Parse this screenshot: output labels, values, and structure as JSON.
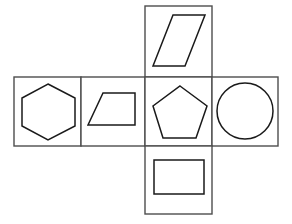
{
  "diagram": {
    "canvas": {
      "width": 292,
      "height": 224,
      "background": "#ffffff"
    },
    "stroke_colors": {
      "cell_border": "#4d4d4d",
      "figure_outline": "#1a1a1a"
    },
    "cells": [
      {
        "id": "cell-top",
        "position": "top",
        "rect": {
          "x": 145,
          "y": 6,
          "width": 67,
          "height": 71
        },
        "figure": {
          "name": "parallelogram",
          "type": "polygon",
          "sides": 4,
          "points": "173,15 205,15 185,66 153,66"
        }
      },
      {
        "id": "cell-left",
        "position": "middle-left",
        "rect": {
          "x": 14,
          "y": 77,
          "width": 67,
          "height": 69
        },
        "figure": {
          "name": "hexagon",
          "type": "polygon",
          "sides": 6,
          "points": "48,84 75,98 75,126 48,140 22,126 22,98"
        }
      },
      {
        "id": "cell-center-left",
        "position": "middle-center-left",
        "rect": {
          "x": 81,
          "y": 77,
          "width": 64,
          "height": 69
        },
        "figure": {
          "name": "trapezoid",
          "type": "polygon",
          "sides": 4,
          "points": "103,93 135,93 135,125 88,125"
        }
      },
      {
        "id": "cell-center-right",
        "position": "middle-center-right",
        "rect": {
          "x": 145,
          "y": 77,
          "width": 67,
          "height": 69
        },
        "figure": {
          "name": "pentagon",
          "type": "polygon",
          "sides": 5,
          "points": "180,86 207,106 196,138 163,138 153,106"
        }
      },
      {
        "id": "cell-right",
        "position": "middle-right",
        "rect": {
          "x": 212,
          "y": 77,
          "width": 66,
          "height": 69
        },
        "figure": {
          "name": "circle",
          "type": "circle",
          "sides": 0,
          "cx": 245,
          "cy": 111,
          "r": 28
        }
      },
      {
        "id": "cell-bottom",
        "position": "bottom",
        "rect": {
          "x": 145,
          "y": 146,
          "width": 67,
          "height": 68
        },
        "figure": {
          "name": "rectangle",
          "type": "polygon",
          "sides": 4,
          "points": "154,160 204,160 204,194 154,194"
        }
      }
    ]
  }
}
